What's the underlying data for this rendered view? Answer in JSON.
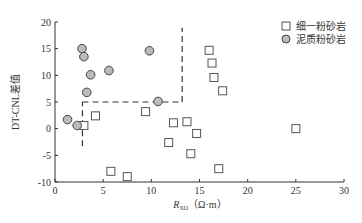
{
  "chart_data": {
    "type": "scatter",
    "title": "",
    "xlabel": "R_XO (Ω·m)",
    "xlabel_main": "R",
    "xlabel_sub": "XO",
    "xlabel_unit": "（Ω·m）",
    "ylabel": "DT-CNL差值",
    "xlim": [
      0,
      30
    ],
    "ylim": [
      -10,
      20
    ],
    "xticks": [
      0,
      5,
      10,
      15,
      20,
      25,
      30
    ],
    "yticks": [
      -10,
      -5,
      0,
      5,
      10,
      15,
      20
    ],
    "grid": false,
    "legend_position": "top-right",
    "series": [
      {
        "name": "细一粉砂岩",
        "marker": "square",
        "fill": "#ffffff",
        "stroke": "#555555",
        "points": [
          [
            3.0,
            0.6
          ],
          [
            4.2,
            2.4
          ],
          [
            5.8,
            -8.0
          ],
          [
            7.5,
            -9.0
          ],
          [
            9.4,
            3.2
          ],
          [
            11.8,
            -2.6
          ],
          [
            12.3,
            1.1
          ],
          [
            13.7,
            1.3
          ],
          [
            14.7,
            -0.9
          ],
          [
            14.1,
            -4.7
          ],
          [
            16.0,
            14.7
          ],
          [
            16.3,
            12.3
          ],
          [
            16.5,
            9.6
          ],
          [
            17.4,
            7.1
          ],
          [
            17.0,
            -7.5
          ],
          [
            25.0,
            0.0
          ]
        ]
      },
      {
        "name": "泥质粉砂岩",
        "marker": "circle",
        "fill": "#bbbbbb",
        "stroke": "#444444",
        "points": [
          [
            1.3,
            1.7
          ],
          [
            2.3,
            0.6
          ],
          [
            2.8,
            15.0
          ],
          [
            3.0,
            13.5
          ],
          [
            3.7,
            10.1
          ],
          [
            3.3,
            6.8
          ],
          [
            5.6,
            10.9
          ],
          [
            9.8,
            14.6
          ],
          [
            10.7,
            5.1
          ]
        ]
      }
    ],
    "annotations": [
      {
        "type": "dashed-line",
        "from": [
          2.85,
          -3.3
        ],
        "to": [
          2.85,
          5.0
        ]
      },
      {
        "type": "dashed-line",
        "from": [
          2.85,
          5.0
        ],
        "to": [
          13.2,
          5.0
        ]
      },
      {
        "type": "dashed-line",
        "from": [
          13.2,
          5.0
        ],
        "to": [
          13.2,
          18.9
        ]
      }
    ]
  },
  "legend": {
    "items": [
      {
        "label": "细一粉砂岩"
      },
      {
        "label": "泥质粉砂岩"
      }
    ]
  }
}
